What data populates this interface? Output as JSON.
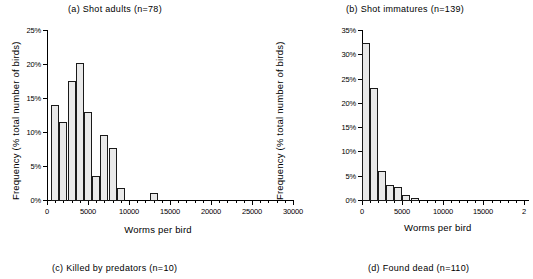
{
  "figure": {
    "background": "#ffffff",
    "bar_fill": "#e9e9e9",
    "bar_stroke": "#1a1a1a",
    "axis_color": "#000000"
  },
  "panels": {
    "a": {
      "title": "(a) Shot adults (n=78)",
      "xlabel": "Worms per bird",
      "ylabel": "Frequency (% total number of birds)",
      "ytick_labels": [
        "0%",
        "5%",
        "10%",
        "15%",
        "20%",
        "25%"
      ],
      "xtick_labels": [
        "0",
        "5000",
        "10000",
        "15000",
        "20000",
        "25000",
        "30000"
      ]
    },
    "b": {
      "title": "(b) Shot immatures (n=139)",
      "xlabel": "Worms per bird",
      "ylabel": "Frequency (% total number of birds)",
      "ytick_labels": [
        "0%",
        "5%",
        "10%",
        "15%",
        "20%",
        "25%",
        "30%",
        "35%"
      ],
      "xtick_labels": [
        "0",
        "5000",
        "10000",
        "15000",
        "2"
      ]
    }
  },
  "bottom_captions": {
    "c": "(c) Killed by predators (n=10)",
    "d": "(d) Found dead (n=110)"
  },
  "chart_data": [
    {
      "id": "a",
      "type": "bar",
      "title": "(a) Shot adults (n=78)",
      "xlabel": "Worms per bird",
      "ylabel": "Frequency (% total number of birds)",
      "xlim": [
        0,
        30000
      ],
      "ylim": [
        0,
        25
      ],
      "xtick_step": 5000,
      "ytick_step": 5,
      "xminor_step": 1000,
      "grid": false,
      "legend": null,
      "bin_width": 1000,
      "bin_starts": [
        500,
        1500,
        2500,
        3500,
        4500,
        5500,
        6500,
        7500,
        8500,
        12500
      ],
      "bin_centers": [
        1000,
        2000,
        3000,
        4000,
        5000,
        6000,
        7000,
        8000,
        9000,
        13000
      ],
      "values": [
        14.0,
        11.5,
        17.5,
        20.1,
        13.0,
        3.6,
        9.6,
        7.6,
        1.7,
        1.1
      ],
      "value_unit": "%"
    },
    {
      "id": "b",
      "type": "bar",
      "title": "(b) Shot immatures (n=139)",
      "xlabel": "Worms per bird",
      "ylabel": "Frequency (% total number of birds)",
      "xlim": [
        0,
        20500
      ],
      "ylim": [
        0,
        35
      ],
      "xtick_step": 5000,
      "ytick_step": 5,
      "xminor_step": 1000,
      "grid": false,
      "legend": null,
      "bin_width": 1000,
      "bin_starts": [
        0,
        1000,
        2000,
        3000,
        4000,
        5000,
        6000
      ],
      "bin_centers": [
        500,
        1500,
        2500,
        3500,
        4500,
        5500,
        6500
      ],
      "values": [
        32.4,
        23.0,
        6.0,
        3.0,
        2.6,
        1.1,
        0.5
      ],
      "value_unit": "%"
    }
  ]
}
